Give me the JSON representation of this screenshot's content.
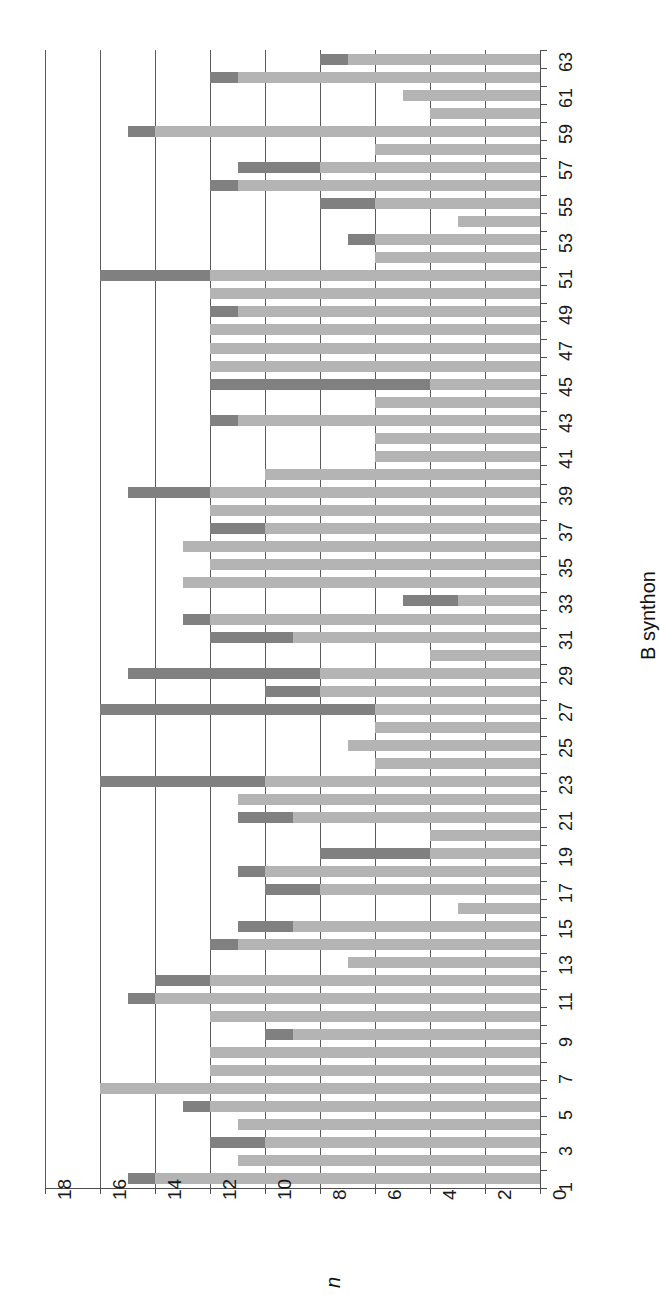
{
  "chart_data": {
    "type": "bar",
    "orientation": "horizontal-rotated",
    "title": "",
    "xlabel": "B synthon",
    "ylabel": "n",
    "ylim": [
      0,
      18
    ],
    "yticks": [
      0,
      2,
      4,
      6,
      8,
      10,
      12,
      14,
      16,
      18
    ],
    "ytick_labels": [
      "0",
      "2",
      "4",
      "6",
      "8",
      "10",
      "12",
      "14",
      "16",
      "18"
    ],
    "grid": true,
    "grid_axis": "value",
    "legend": null,
    "stacked": true,
    "colors": {
      "light": "#b4b4b4",
      "dark": "#808080",
      "axis": "#4d4d4d",
      "grid": "#5a5a5a"
    },
    "categories": [
      1,
      2,
      3,
      4,
      5,
      6,
      7,
      8,
      9,
      10,
      11,
      12,
      13,
      14,
      15,
      16,
      17,
      18,
      19,
      20,
      21,
      22,
      23,
      24,
      25,
      26,
      27,
      28,
      29,
      30,
      31,
      32,
      33,
      34,
      35,
      36,
      37,
      38,
      39,
      40,
      41,
      42,
      43,
      44,
      45,
      46,
      47,
      48,
      49,
      50,
      51,
      52,
      53,
      54,
      55,
      56,
      57,
      58,
      59,
      60,
      61,
      62,
      63
    ],
    "category_tick_labels": [
      "1",
      "3",
      "5",
      "7",
      "9",
      "11",
      "13",
      "15",
      "17",
      "19",
      "21",
      "23",
      "25",
      "27",
      "29",
      "31",
      "33",
      "35",
      "37",
      "39",
      "41",
      "43",
      "45",
      "47",
      "49",
      "51",
      "53",
      "55",
      "57",
      "59",
      "61",
      "63"
    ],
    "series": [
      {
        "name": "light",
        "values": [
          14,
          11,
          10,
          11,
          12,
          16,
          12,
          12,
          9,
          12,
          14,
          12,
          7,
          11,
          9,
          3,
          8,
          10,
          4,
          4,
          9,
          11,
          10,
          6,
          7,
          6,
          6,
          8,
          8,
          4,
          9,
          12,
          3,
          13,
          12,
          13,
          10,
          12,
          12,
          10,
          6,
          6,
          11,
          6,
          4,
          12,
          12,
          12,
          11,
          12,
          12,
          6,
          6,
          3,
          6,
          11,
          8,
          6,
          14,
          4,
          5,
          11,
          7
        ]
      },
      {
        "name": "dark",
        "values": [
          1,
          0,
          2,
          0,
          1,
          0,
          0,
          0,
          1,
          0,
          1,
          2,
          0,
          1,
          2,
          0,
          2,
          1,
          4,
          0,
          2,
          0,
          6,
          0,
          0,
          0,
          10,
          2,
          7,
          0,
          3,
          1,
          2,
          0,
          0,
          0,
          2,
          0,
          3,
          0,
          0,
          0,
          1,
          0,
          8,
          0,
          0,
          0,
          1,
          0,
          4,
          0,
          1,
          0,
          2,
          1,
          3,
          0,
          1,
          0,
          0,
          1,
          1
        ]
      }
    ],
    "bar_totals": [
      15,
      11,
      12,
      11,
      13,
      16,
      12,
      12,
      10,
      12,
      15,
      14,
      7,
      12,
      11,
      3,
      10,
      11,
      8,
      4,
      11,
      11,
      16,
      6,
      7,
      6,
      16,
      10,
      15,
      4,
      12,
      13,
      5,
      13,
      12,
      13,
      12,
      12,
      15,
      10,
      6,
      6,
      12,
      6,
      12,
      12,
      12,
      12,
      12,
      12,
      16,
      6,
      7,
      3,
      8,
      12,
      11,
      6,
      15,
      4,
      5,
      12,
      8
    ]
  },
  "axes": {
    "value_axis_title": "n",
    "category_axis_title": "B synthon"
  }
}
